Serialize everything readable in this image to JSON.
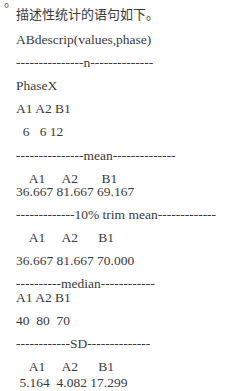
{
  "partial_top_text": "。",
  "intro": "描述性统计的语句如下。",
  "command": "ABdescrip(values,phase)",
  "sections": [
    {
      "header": "---------------n--------------",
      "rows": [
        "PhaseX",
        "A1 A2 B1",
        "  6   6 12"
      ]
    },
    {
      "header": "---------------mean--------------",
      "rows": [
        "    A1     A2       B1",
        "36.667 81.667 69.167"
      ]
    },
    {
      "header": "-------------10% trim mean-------------",
      "rows": [
        "    A1     A2      B1",
        "36.667 81.667 70.000"
      ]
    },
    {
      "header": "----------median------------",
      "rows": [
        "A1 A2 B1",
        "40  80  70"
      ]
    },
    {
      "header": "------------SD--------------",
      "rows": [
        "    A1     A2      B1",
        " 5.164  4.082 17.299"
      ]
    }
  ]
}
